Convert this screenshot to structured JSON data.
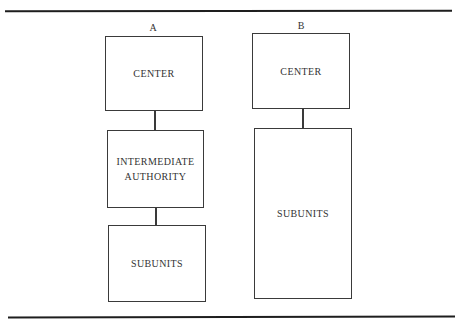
{
  "diagram": {
    "type": "organizational-hierarchy-comparison",
    "columns": [
      {
        "label": "A",
        "nodes": [
          {
            "id": "a-center",
            "text": "CENTER"
          },
          {
            "id": "a-intermediate",
            "text": "INTERMEDIATE\nAUTHORITY"
          },
          {
            "id": "a-subunits",
            "text": "SUBUNITS"
          }
        ],
        "edges": [
          {
            "from": "a-center",
            "to": "a-intermediate"
          },
          {
            "from": "a-intermediate",
            "to": "a-subunits"
          }
        ]
      },
      {
        "label": "B",
        "nodes": [
          {
            "id": "b-center",
            "text": "CENTER"
          },
          {
            "id": "b-subunits",
            "text": "SUBUNITS"
          }
        ],
        "edges": [
          {
            "from": "b-center",
            "to": "b-subunits"
          }
        ]
      }
    ]
  }
}
